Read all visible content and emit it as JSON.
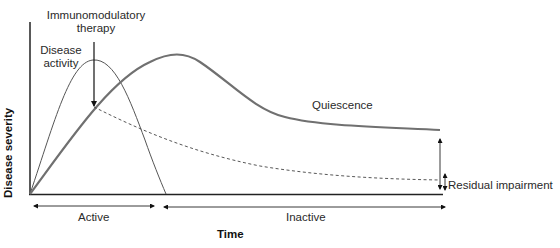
{
  "diagram": {
    "y_axis_label": "Disease severity",
    "x_axis_label": "Time",
    "annotations": {
      "therapy_line1": "Immunomodulatory",
      "therapy_line2": "therapy",
      "activity_line1": "Disease",
      "activity_line2": "activity",
      "quiescence": "Quiescence",
      "residual": "Residual impairment"
    },
    "phases": {
      "active": "Active",
      "inactive": "Inactive"
    },
    "colors": {
      "thin_curve": "#555555",
      "thick_curve": "#707070",
      "axes": "#222222",
      "dashed": "#444444"
    }
  }
}
